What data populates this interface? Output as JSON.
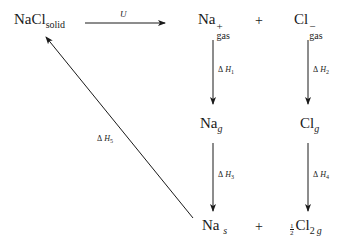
{
  "diagram": {
    "type": "Born-Haber cycle",
    "nodes": {
      "nacl_solid": {
        "base": "NaCl",
        "sub": "solid"
      },
      "na_gas_ion": {
        "base": "Na",
        "charge": "+",
        "sub": "gas"
      },
      "cl_gas_ion": {
        "base": "Cl",
        "charge": "−",
        "sub": "gas"
      },
      "na_g": {
        "base": "Na",
        "sub": "g"
      },
      "cl_g": {
        "base": "Cl",
        "sub": "g"
      },
      "na_s": {
        "base": "Na",
        "sub": "s"
      },
      "half_cl2_g": {
        "coef_num": "1",
        "coef_den": "2",
        "base": "Cl",
        "sub2": "2",
        "sub": "g"
      }
    },
    "plus_signs": [
      "+",
      "+"
    ],
    "edges": [
      {
        "from": "nacl_solid",
        "to": "na_gas_ion + cl_gas_ion",
        "label": "U"
      },
      {
        "from": "na_gas_ion",
        "to": "na_g",
        "label_delta": "Δ",
        "label_var": "H",
        "label_sub": "1"
      },
      {
        "from": "cl_gas_ion",
        "to": "cl_g",
        "label_delta": "Δ",
        "label_var": "H",
        "label_sub": "2"
      },
      {
        "from": "na_g",
        "to": "na_s",
        "label_delta": "Δ",
        "label_var": "H",
        "label_sub": "3"
      },
      {
        "from": "cl_g",
        "to": "half_cl2_g",
        "label_delta": "Δ",
        "label_var": "H",
        "label_sub": "4"
      },
      {
        "from": "na_s + half_cl2_g",
        "to": "nacl_solid",
        "label_delta": "Δ",
        "label_var": "H",
        "label_sub": "5"
      }
    ]
  }
}
